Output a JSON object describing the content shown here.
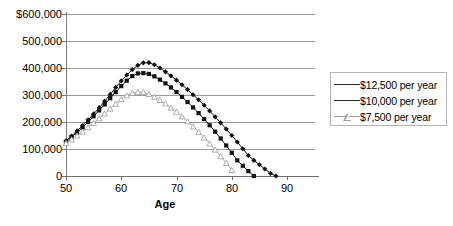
{
  "chart_data": {
    "type": "line",
    "title": "",
    "subtitle": "",
    "xlabel": "Age",
    "ylabel": "",
    "xlim": [
      50,
      95
    ],
    "ylim": [
      0,
      600000
    ],
    "grid": "horizontal",
    "legend_position": "right",
    "x_ticks": [
      "50",
      "60",
      "70",
      "80",
      "90"
    ],
    "x_tick_values": [
      50,
      60,
      70,
      80,
      90
    ],
    "y_ticks": [
      "$600,000",
      "500,000",
      "400,000",
      "300,000",
      "200,000",
      "100,000",
      "0"
    ],
    "y_tick_values": [
      600000,
      500000,
      400000,
      300000,
      200000,
      100000,
      0
    ],
    "series": [
      {
        "name": "$12,500 per year",
        "marker": "diamond-filled",
        "color": "#111111",
        "x": [
          50,
          51,
          52,
          53,
          54,
          55,
          56,
          57,
          58,
          59,
          60,
          61,
          62,
          63,
          64,
          65,
          66,
          67,
          68,
          69,
          70,
          71,
          72,
          73,
          74,
          75,
          76,
          77,
          78,
          79,
          80,
          81,
          82,
          83,
          84,
          85,
          86,
          87,
          88
        ],
        "values": [
          130000,
          148000,
          167000,
          187000,
          208000,
          230000,
          253000,
          277000,
          302000,
          328000,
          352000,
          374000,
          394000,
          410000,
          419000,
          420000,
          412000,
          400000,
          386000,
          371000,
          355000,
          338000,
          320000,
          301000,
          282000,
          262000,
          241000,
          219000,
          197000,
          174000,
          150000,
          126000,
          101000,
          76000,
          58000,
          42000,
          26000,
          10000,
          0
        ]
      },
      {
        "name": "$10,000 per year",
        "marker": "square-filled",
        "color": "#111111",
        "x": [
          50,
          51,
          52,
          53,
          54,
          55,
          56,
          57,
          58,
          59,
          60,
          61,
          62,
          63,
          64,
          65,
          66,
          67,
          68,
          69,
          70,
          71,
          72,
          73,
          74,
          75,
          76,
          77,
          78,
          79,
          80,
          81,
          82,
          83,
          84
        ],
        "values": [
          126000,
          143000,
          161000,
          180000,
          200000,
          221000,
          243000,
          265000,
          288000,
          311000,
          333000,
          353000,
          370000,
          380000,
          381000,
          378000,
          369000,
          357000,
          343000,
          328000,
          311000,
          293000,
          274000,
          254000,
          233000,
          211000,
          188000,
          164000,
          139000,
          113000,
          86000,
          58000,
          38000,
          18000,
          0
        ]
      },
      {
        "name": "$7,500 per year",
        "marker": "triangle-open",
        "color": "#9b9b9b",
        "x": [
          50,
          51,
          52,
          53,
          54,
          55,
          56,
          57,
          58,
          59,
          60,
          61,
          62,
          63,
          64,
          65,
          66,
          67,
          68,
          69,
          70,
          71,
          72,
          73,
          74,
          75,
          76,
          77,
          78,
          79,
          80
        ],
        "values": [
          122000,
          135000,
          149000,
          164000,
          180000,
          196000,
          213000,
          231000,
          249000,
          267000,
          284000,
          298000,
          307000,
          311000,
          310000,
          303000,
          293000,
          281000,
          268000,
          253000,
          237000,
          220000,
          202000,
          183000,
          163000,
          142000,
          120000,
          97000,
          73000,
          48000,
          22000
        ]
      }
    ]
  },
  "legend": {
    "items": [
      {
        "label": "$12,500 per year",
        "marker": "diamond-filled"
      },
      {
        "label": "$10,000 per year",
        "marker": "square-filled"
      },
      {
        "label": "$7,500 per year",
        "marker": "triangle-open"
      }
    ]
  },
  "axes": {
    "x_title": "Age"
  }
}
